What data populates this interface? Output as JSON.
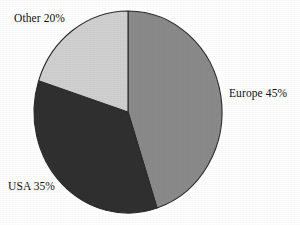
{
  "chart_data": {
    "type": "pie",
    "title": "",
    "categories": [
      "Europe",
      "USA",
      "Other"
    ],
    "values": [
      45,
      35,
      20
    ],
    "unit": "%",
    "labels": [
      "Europe 45%",
      "USA 35%",
      "Other 20%"
    ],
    "colors": [
      "#8a8a8a",
      "#303030",
      "#d0d0d0"
    ],
    "start_angle_deg": 0,
    "direction": "clockwise",
    "legend": "none",
    "grid": false,
    "background": "#ffffff",
    "outline_color": "#2b2b2b",
    "slices": [
      {
        "name": "Europe",
        "value": 45,
        "label": "Europe 45%",
        "color": "#8a8a8a",
        "sweep_deg": 162
      },
      {
        "name": "USA",
        "value": 35,
        "label": "USA 35%",
        "color": "#303030",
        "sweep_deg": 126
      },
      {
        "name": "Other",
        "value": 20,
        "label": "Other 20%",
        "color": "#d0d0d0",
        "sweep_deg": 72
      }
    ],
    "geometry": {
      "cx": 128,
      "cy": 112,
      "rx": 94,
      "ry": 101
    }
  }
}
